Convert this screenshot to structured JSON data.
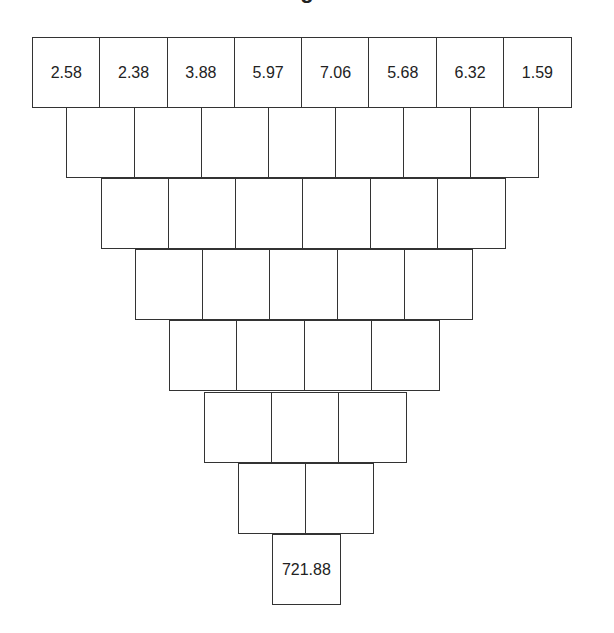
{
  "title": "g",
  "diagram": {
    "type": "number-pyramid",
    "rows": [
      {
        "cells": [
          "2.58",
          "2.38",
          "3.88",
          "5.97",
          "7.06",
          "5.68",
          "6.32",
          "1.59"
        ]
      },
      {
        "cells": [
          "",
          "",
          "",
          "",
          "",
          "",
          ""
        ]
      },
      {
        "cells": [
          "",
          "",
          "",
          "",
          "",
          ""
        ]
      },
      {
        "cells": [
          "",
          "",
          "",
          "",
          ""
        ]
      },
      {
        "cells": [
          "",
          "",
          "",
          ""
        ]
      },
      {
        "cells": [
          "",
          "",
          ""
        ]
      },
      {
        "cells": [
          "",
          ""
        ]
      },
      {
        "cells": [
          "721.88"
        ]
      }
    ]
  }
}
